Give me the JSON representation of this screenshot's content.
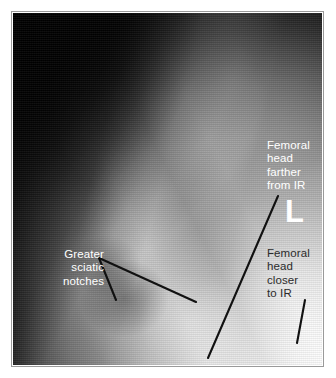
{
  "figure": {
    "kind": "annotated-radiograph",
    "modality_view": "lateral sacrum / pelvis radiograph"
  },
  "annotations": [
    {
      "id": "greater-sciatic-notches",
      "text": "Greater\nsciatic\nnotches",
      "color": "#ffffff",
      "align": "right"
    },
    {
      "id": "femoral-head-farther",
      "text": "Femoral\nhead\nfarther\nfrom IR",
      "color": "#ffffff",
      "align": "left"
    },
    {
      "id": "femoral-head-closer",
      "text": "Femoral\nhead\ncloser\nto IR",
      "color": "#2b2b2b",
      "align": "left"
    }
  ],
  "markers": {
    "side_marker": "L",
    "side_marker_color": "#ffffff"
  },
  "leader_lines": {
    "color": "#111111",
    "lines": [
      {
        "name": "sciatic-notch-upper",
        "x1": 99,
        "y1": 258,
        "x2": 196,
        "y2": 302
      },
      {
        "name": "sciatic-notch-lower",
        "x1": 99,
        "y1": 258,
        "x2": 116,
        "y2": 300
      },
      {
        "name": "femoral-head-farther-leader",
        "x1": 278,
        "y1": 196,
        "x2": 208,
        "y2": 358
      },
      {
        "name": "femoral-head-closer-leader",
        "x1": 305,
        "y1": 300,
        "x2": 297,
        "y2": 343
      }
    ]
  },
  "frame": {
    "page_background": "#ffffff",
    "border_color": "#9a9a9a"
  }
}
